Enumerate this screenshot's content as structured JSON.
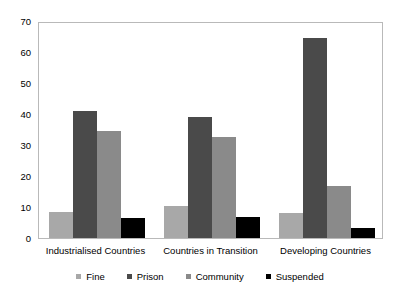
{
  "chart_data": {
    "type": "bar",
    "title": "",
    "subtitle": "",
    "xlabel": "",
    "ylabel": "",
    "ylim": [
      0,
      70
    ],
    "ytick_step": 10,
    "yticks": [
      "0",
      "10",
      "20",
      "30",
      "40",
      "50",
      "60",
      "70"
    ],
    "grid": false,
    "legend_position": "bottom",
    "categories": [
      "Industrialised Countries",
      "Countries in Transition",
      "Developing Countries"
    ],
    "series": [
      {
        "name": "Fine",
        "color": "#a8a8a8",
        "values": [
          8.5,
          10.3,
          8.2
        ]
      },
      {
        "name": "Prison",
        "color": "#4a4a4a",
        "values": [
          41.0,
          39.0,
          64.5
        ]
      },
      {
        "name": "Community",
        "color": "#8a8a8a",
        "values": [
          34.5,
          32.5,
          16.7
        ]
      },
      {
        "name": "Suspended",
        "color": "#000000",
        "values": [
          6.5,
          6.7,
          3.3
        ]
      }
    ]
  },
  "legend": {
    "items": [
      {
        "label": "Fine",
        "color": "#a8a8a8"
      },
      {
        "label": "Prison",
        "color": "#4a4a4a"
      },
      {
        "label": "Community",
        "color": "#8a8a8a"
      },
      {
        "label": "Suspended",
        "color": "#000000"
      }
    ]
  },
  "axes": {
    "frame_color": "#b9b9b9",
    "tick_color": "#9a9a9a"
  }
}
